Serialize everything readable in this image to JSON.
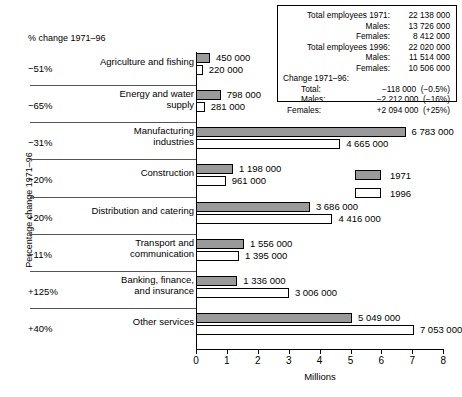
{
  "chart_data": {
    "type": "bar",
    "title": "",
    "xlabel": "Millions",
    "ylabel": "Percentage change 1971–96",
    "xlim": [
      0,
      8
    ],
    "xticks": [
      "0",
      "1",
      "2",
      "3",
      "4",
      "5",
      "6",
      "7",
      "8"
    ],
    "grid": false,
    "legend_position": "right-middle",
    "pct_header": "% change 1971–96",
    "legend": [
      {
        "name": "1971",
        "color": "#9a9a9a"
      },
      {
        "name": "1996",
        "color": "#ffffff"
      }
    ],
    "categories": [
      "Agriculture and fishing",
      "Energy and water supply",
      "Manufacturing industries",
      "Construction",
      "Distribution and catering",
      "Transport and communication",
      "Banking, finance, and insurance",
      "Other services"
    ],
    "category_lines": [
      [
        "Agriculture and fishing"
      ],
      [
        "Energy and water",
        "supply"
      ],
      [
        "Manufacturing",
        "industries"
      ],
      [
        "Construction"
      ],
      [
        "Distribution and catering"
      ],
      [
        "Transport and",
        "communication"
      ],
      [
        "Banking, finance,",
        "and insurance"
      ],
      [
        "Other services"
      ]
    ],
    "pct_change": [
      "−51%",
      "−65%",
      "−31%",
      "−20%",
      "+20%",
      "−11%",
      "+125%",
      "+40%"
    ],
    "series": [
      {
        "name": "1971",
        "values": [
          450000,
          798000,
          6783000,
          1198000,
          3686000,
          1556000,
          1336000,
          5049000
        ],
        "labels": [
          "450 000",
          "798 000",
          "6 783 000",
          "1 198 000",
          "3 686 000",
          "1 556 000",
          "1 336 000",
          "5 049 000"
        ]
      },
      {
        "name": "1996",
        "values": [
          220000,
          281000,
          4665000,
          961000,
          4416000,
          1395000,
          3006000,
          7053000
        ],
        "labels": [
          "220 000",
          "281 000",
          "4 665 000",
          "961 000",
          "4 416 000",
          "1 395 000",
          "3 006 000",
          "7 053 000"
        ]
      }
    ]
  },
  "infobox": {
    "rows": [
      {
        "kind": "pair",
        "label": "Total employees 1971:",
        "value": "22 138 000"
      },
      {
        "kind": "pair",
        "label": "Males:",
        "value": "13 726 000"
      },
      {
        "kind": "pair",
        "label": "Females:",
        "value": "8 412 000"
      },
      {
        "kind": "pair",
        "label": "Total employees 1996:",
        "value": "22 020 000"
      },
      {
        "kind": "pair",
        "label": "Males:",
        "value": "11 514 000"
      },
      {
        "kind": "pair",
        "label": "Females:",
        "value": "10 506 000"
      },
      {
        "kind": "full",
        "label": "Change 1971–96:",
        "value": ""
      },
      {
        "kind": "ind",
        "label": "Total:",
        "value": "−118 000  (−0.5%)"
      },
      {
        "kind": "ind",
        "label": "Males:",
        "value": "−2 212 000  (−16%)"
      },
      {
        "kind": "ind2",
        "label": "Females:",
        "value": "+2 094 000  (+25%)"
      }
    ]
  },
  "caption": {
    "text": ""
  }
}
